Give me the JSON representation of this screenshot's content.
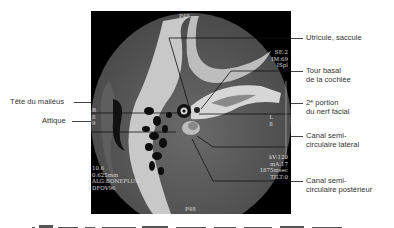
{
  "figure": {
    "left_labels": [
      {
        "text": "Tête du malléus"
      },
      {
        "text": "Attique"
      }
    ],
    "right_labels": [
      {
        "line1": "Utricule, saccule",
        "line2": ""
      },
      {
        "line1": "Tour basal",
        "line2": "de la cochlée"
      },
      {
        "line1": "2ᵉ portion",
        "line2": "du nerf facial"
      },
      {
        "line1": "Canal semi-",
        "line2": "circulaire latéral"
      },
      {
        "line1": "Canal semi-",
        "line2": "circulaire postérieur"
      }
    ],
    "ct_overlay": {
      "top_center": "P48",
      "bottom_center": "P48",
      "top_right": "SE:2\nIM:69\nISpl",
      "left_mid": "R\n8\n9",
      "right_mid": "L\n8",
      "bottom_left": "10.6\n0.625mm\nALG:BONEPLUS\nDFOV96",
      "bottom_right": "kV:120\nmA:17\n1875msec\nTILT:0"
    },
    "caption_partial": "………"
  }
}
